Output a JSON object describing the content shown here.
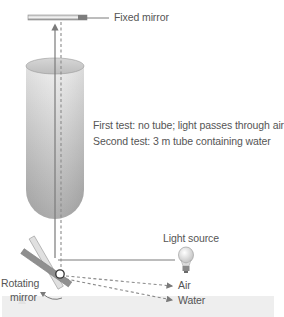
{
  "diagram": {
    "type": "Foucault speed-of-light apparatus",
    "labels": {
      "fixed_mirror": "Fixed mirror",
      "test_1": "First test: no tube; light passes through air",
      "test_2": "Second test: 3 m tube containing water",
      "light_source": "Light source",
      "rotating_mirror_line1": "Rotating",
      "rotating_mirror_line2": "mirror",
      "air": "Air",
      "water": "Water"
    },
    "components": [
      {
        "name": "fixed-mirror",
        "desc": "horizontal mirror at top"
      },
      {
        "name": "water-tube",
        "desc": "vertical cylinder containing water between mirrors"
      },
      {
        "name": "rotating-mirror",
        "desc": "tilted rotating mirror at bottom left"
      },
      {
        "name": "light-source",
        "desc": "light bulb at right"
      }
    ],
    "colors": {
      "line": "#808080",
      "tube_light": "#e6e6e6",
      "tube_dark": "#a8a8a8",
      "mirror": "#9a9a9a",
      "text": "#555555",
      "band": "#eeeeee"
    }
  }
}
